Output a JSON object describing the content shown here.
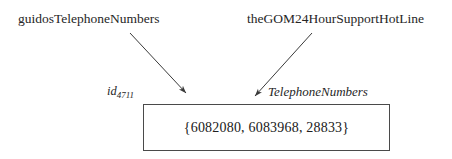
{
  "diagram": {
    "source_labels": [
      {
        "id": "left",
        "text": "guidosTelephoneNumbers"
      },
      {
        "id": "right",
        "text": "theGOM24HourSupportHotLine"
      }
    ],
    "object_identifier": {
      "base": "id",
      "subscript": "4711"
    },
    "type_label": "TelephoneNumbers",
    "value_box": {
      "content": "{6082080, 6083968, 28833}",
      "elements": [
        "6082080",
        "6083968",
        "28833"
      ],
      "border_color": "#4a4a4a",
      "fill_color": "#ffffff"
    },
    "arrows": [
      {
        "id": "left-arrow",
        "from": [
          130,
          33
        ],
        "to": [
          188,
          95
        ],
        "color": "#3a3a3a"
      },
      {
        "id": "right-arrow",
        "from": [
          312,
          33
        ],
        "to": [
          253,
          98
        ],
        "color": "#3a3a3a"
      }
    ]
  }
}
